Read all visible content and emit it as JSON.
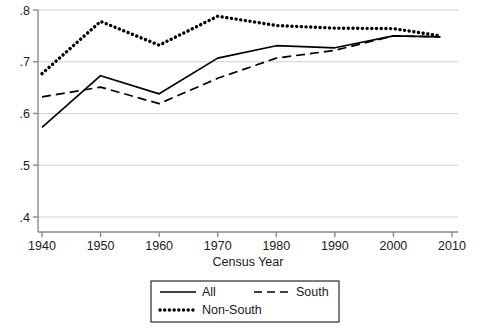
{
  "chart_data": {
    "type": "line",
    "title": "",
    "xlabel": "Census Year",
    "ylabel": "",
    "xlim": [
      1940,
      2010
    ],
    "ylim": [
      0.4,
      0.8
    ],
    "grid": true,
    "grid_axis": "y",
    "legend_position": "below",
    "x_ticks": [
      1940,
      1950,
      1960,
      1970,
      1980,
      1990,
      2000,
      2010
    ],
    "x_tick_labels": [
      "1940",
      "1950",
      "1960",
      "1970",
      "1980",
      "1990",
      "2000",
      "2010"
    ],
    "y_ticks": [
      0.4,
      0.5,
      0.6,
      0.7,
      0.8
    ],
    "y_tick_labels": [
      ".4",
      ".5",
      ".6",
      ".7",
      ".8"
    ],
    "x": [
      1940,
      1950,
      1960,
      1970,
      1980,
      1990,
      2000,
      2008
    ],
    "series": [
      {
        "name": "All",
        "style": "solid",
        "color": "#000000",
        "values": [
          0.573,
          0.673,
          0.638,
          0.707,
          0.731,
          0.727,
          0.75,
          0.748
        ]
      },
      {
        "name": "South",
        "style": "dashed",
        "color": "#000000",
        "values": [
          0.632,
          0.651,
          0.619,
          0.668,
          0.707,
          0.722,
          0.75,
          0.748
        ]
      },
      {
        "name": "Non-South",
        "style": "dotted",
        "color": "#000000",
        "values": [
          0.677,
          0.778,
          0.732,
          0.788,
          0.77,
          0.765,
          0.764,
          0.75
        ]
      }
    ]
  },
  "legend": {
    "items": [
      {
        "label": "All",
        "style": "solid"
      },
      {
        "label": "South",
        "style": "dashed"
      },
      {
        "label": "Non-South",
        "style": "dotted"
      }
    ]
  },
  "axes": {
    "x_title": "Census Year",
    "y_title": ""
  },
  "colors": {
    "line": "#000000",
    "grid": "#cfcfcf",
    "axis": "#8a8a8a",
    "background": "#ffffff",
    "text": "#1a1a1a"
  }
}
